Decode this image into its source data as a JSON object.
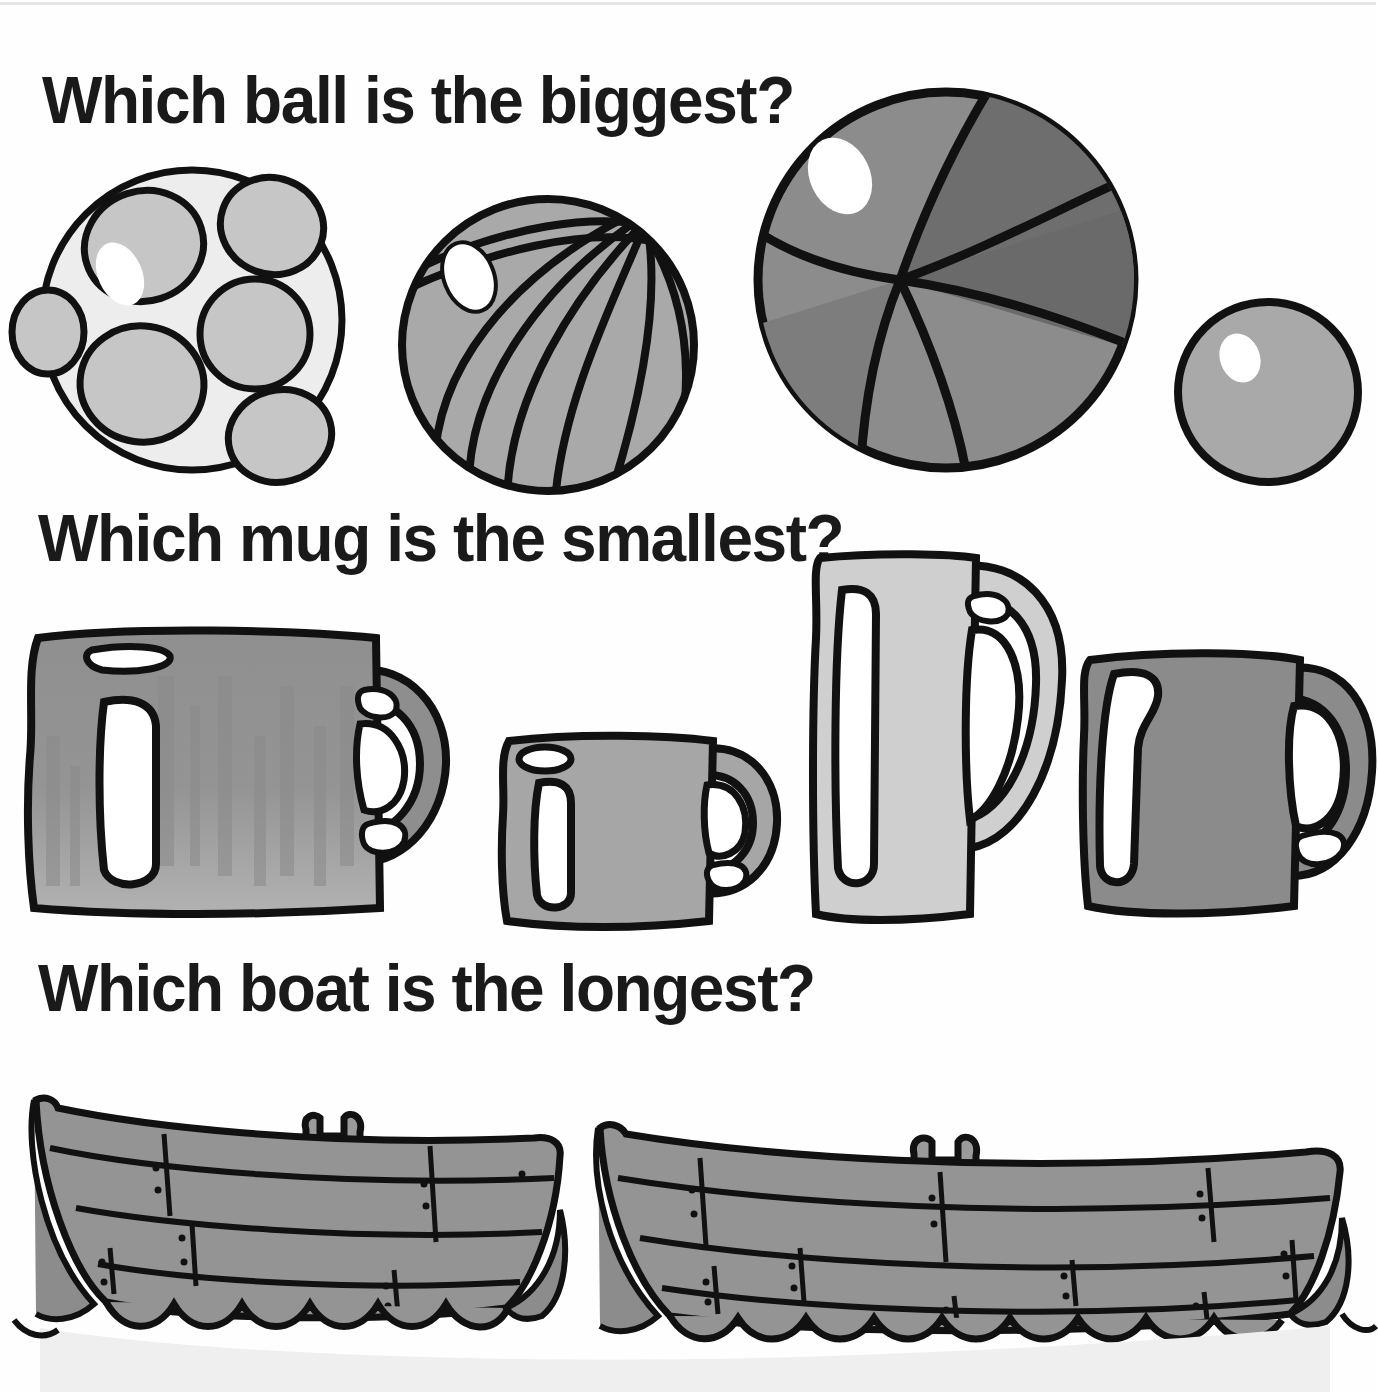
{
  "page": {
    "title": "Which ball is the biggest?",
    "background_color": "#fefefe",
    "ink_color": "#1a1a1a"
  },
  "questions": [
    {
      "id": "q1",
      "text": "Which ball is the biggest?",
      "topic": "ball",
      "attribute": "biggest"
    },
    {
      "id": "q2",
      "text": "Which mug is the smallest?",
      "topic": "mug",
      "attribute": "smallest"
    },
    {
      "id": "q3",
      "text": "Which boat is the longest?",
      "topic": "boat",
      "attribute": "longest"
    }
  ],
  "rows": {
    "balls": {
      "label": "balls-row",
      "items": [
        {
          "name": "polka-dot-ball",
          "order": 1,
          "size": "large",
          "diameter_px": 308,
          "fill": "#ededed",
          "detail_fill": "#c9c9c9",
          "pattern": "spots",
          "highlight": true
        },
        {
          "name": "striped-beach-ball",
          "order": 2,
          "size": "medium",
          "diameter_px": 300,
          "fill": "#a9a9a9",
          "detail_fill": "#9a9a9a",
          "pattern": "stripes",
          "highlight": true
        },
        {
          "name": "big-beach-ball",
          "order": 3,
          "size": "biggest",
          "diameter_px": 380,
          "fill": "#8a8a8a",
          "detail_fill": "#6e6e6e",
          "pattern": "segments",
          "highlight": true
        },
        {
          "name": "small-plain-ball",
          "order": 4,
          "size": "smallest",
          "diameter_px": 186,
          "fill": "#a9a9a9",
          "detail_fill": "#a9a9a9",
          "pattern": "plain",
          "highlight": true
        }
      ]
    },
    "mugs": {
      "label": "mugs-row",
      "items": [
        {
          "name": "large-mug",
          "order": 1,
          "size": "largest",
          "height_px": 295,
          "fill": "#9b9b9b",
          "shading": "streaked"
        },
        {
          "name": "small-mug",
          "order": 2,
          "size": "smallest",
          "height_px": 190,
          "fill": "#a6a6a6",
          "shading": "flat"
        },
        {
          "name": "tall-mug",
          "order": 3,
          "size": "tallest",
          "height_px": 370,
          "fill": "#cfcfcf",
          "shading": "flat"
        },
        {
          "name": "medium-mug",
          "order": 4,
          "size": "medium",
          "height_px": 265,
          "fill": "#8b8b8b",
          "shading": "flat"
        }
      ]
    },
    "boats": {
      "label": "boats-row",
      "items": [
        {
          "name": "short-boat",
          "order": 1,
          "size": "shorter",
          "length_px": 540,
          "fill": "#949494",
          "has_cleat": true,
          "planks": 4
        },
        {
          "name": "long-boat",
          "order": 2,
          "size": "longest",
          "length_px": 760,
          "fill": "#949494",
          "has_cleat": true,
          "planks": 4
        }
      ],
      "water": {
        "name": "water",
        "fill": "#efefef",
        "style": "scalloped-waves"
      }
    }
  }
}
